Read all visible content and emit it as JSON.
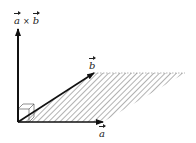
{
  "diagram": {
    "labels": {
      "cross_product": {
        "a": "a",
        "op": "×",
        "b": "b"
      },
      "vector_a": "a",
      "vector_b": "b"
    },
    "geometry": {
      "origin": [
        18,
        122
      ],
      "vector_a_tip": [
        103,
        122
      ],
      "vector_b_tip": [
        94,
        73
      ],
      "cross_tip": [
        18,
        28
      ],
      "parallelogram": [
        [
          18,
          122
        ],
        [
          103,
          122
        ],
        [
          185,
          73
        ],
        [
          94,
          73
        ]
      ]
    },
    "colors": {
      "vector": "#111111",
      "hatch": "#555555",
      "background": "#ffffff"
    }
  }
}
